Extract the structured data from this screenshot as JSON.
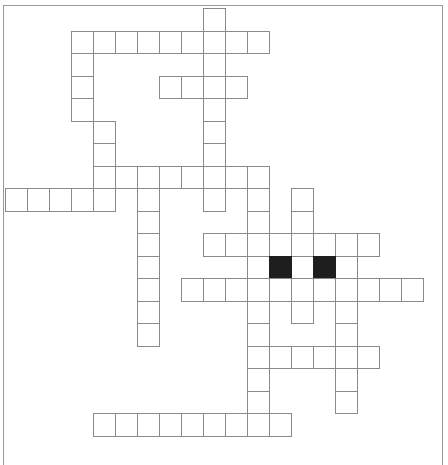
{
  "puzzle": {
    "type": "crossword",
    "cell_width": 22,
    "cell_height": 22.5,
    "origin_x": 5,
    "origin_y": 8,
    "colors": {
      "cell_border": "#8a8a8a",
      "block": "#1e1e1e",
      "frame": "#9a9a9a",
      "background": "#ffffff"
    },
    "rows": [
      {
        "row": 0,
        "white": [
          9
        ],
        "black": []
      },
      {
        "row": 1,
        "white": [
          3,
          4,
          5,
          6,
          7,
          8,
          9,
          10,
          11
        ],
        "black": []
      },
      {
        "row": 2,
        "white": [
          3,
          9
        ],
        "black": []
      },
      {
        "row": 3,
        "white": [
          3,
          7,
          8,
          9,
          10
        ],
        "black": []
      },
      {
        "row": 4,
        "white": [
          3,
          9
        ],
        "black": []
      },
      {
        "row": 5,
        "white": [
          4,
          9
        ],
        "black": []
      },
      {
        "row": 6,
        "white": [
          4,
          9
        ],
        "black": []
      },
      {
        "row": 7,
        "white": [
          4,
          5,
          6,
          7,
          8,
          9,
          10,
          11
        ],
        "black": []
      },
      {
        "row": 8,
        "white": [
          0,
          1,
          2,
          3,
          4,
          6,
          9,
          11,
          13
        ],
        "black": []
      },
      {
        "row": 9,
        "white": [
          6,
          11,
          13
        ],
        "black": []
      },
      {
        "row": 10,
        "white": [
          6,
          9,
          10,
          11,
          12,
          13,
          14,
          15,
          16
        ],
        "black": []
      },
      {
        "row": 11,
        "white": [
          6,
          11,
          13,
          15
        ],
        "black": [
          12,
          14
        ]
      },
      {
        "row": 12,
        "white": [
          6,
          8,
          9,
          10,
          11,
          12,
          13,
          14,
          15,
          16,
          17,
          18
        ],
        "black": []
      },
      {
        "row": 13,
        "white": [
          6,
          11,
          13,
          15
        ],
        "black": []
      },
      {
        "row": 14,
        "white": [
          6,
          11,
          15
        ],
        "black": []
      },
      {
        "row": 15,
        "white": [
          11,
          12,
          13,
          14,
          15,
          16
        ],
        "black": []
      },
      {
        "row": 16,
        "white": [
          11,
          15
        ],
        "black": []
      },
      {
        "row": 17,
        "white": [
          11,
          15
        ],
        "black": []
      },
      {
        "row": 18,
        "white": [
          4,
          5,
          6,
          7,
          8,
          9,
          10,
          11,
          12
        ],
        "black": []
      }
    ]
  }
}
